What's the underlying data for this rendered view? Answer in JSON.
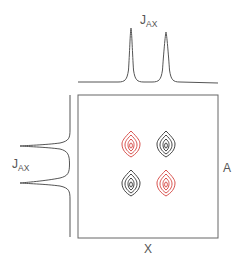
{
  "diagram": {
    "type": "2D NMR COSY-style contour plot with projections",
    "top_projection": {
      "label_main": "J",
      "label_sub": "AX",
      "peaks_x": [
        131,
        166
      ]
    },
    "left_projection": {
      "label_main": "J",
      "label_sub": "AX",
      "peaks_y": [
        146,
        183
      ]
    },
    "axis_right_label": "A",
    "axis_bottom_label": "X",
    "colors": {
      "line": "#555555",
      "positive_contour": "#444444",
      "negative_contour": "#d9534f"
    },
    "crosspeaks": [
      {
        "position": "top-left",
        "color": "red"
      },
      {
        "position": "top-right",
        "color": "black"
      },
      {
        "position": "bottom-left",
        "color": "black"
      },
      {
        "position": "bottom-right",
        "color": "red"
      }
    ]
  }
}
